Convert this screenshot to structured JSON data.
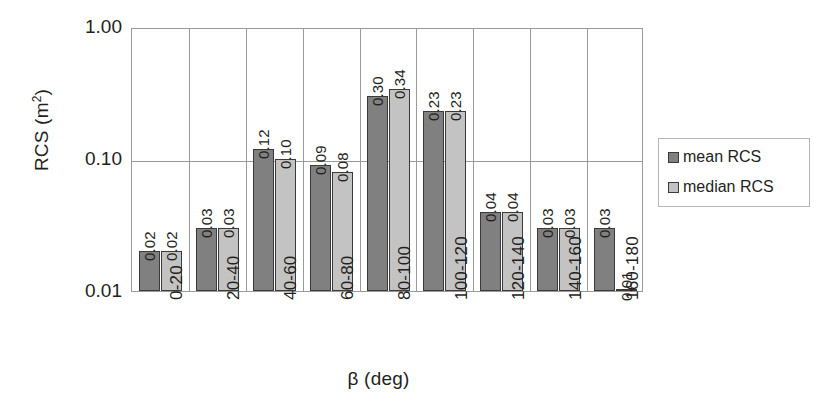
{
  "chart_data": {
    "type": "bar",
    "title": "",
    "xlabel": "β (deg)",
    "ylabel": "RCS (m²)",
    "yscale": "log",
    "ylim": [
      0.01,
      1.0
    ],
    "ytick_labels": [
      "1.00",
      "0.10",
      "0.01"
    ],
    "ytick_values": [
      1.0,
      0.1,
      0.01
    ],
    "grid": "horizontal-and-vertical",
    "legend_position": "right",
    "categories": [
      "0-20",
      "20-40",
      "40-60",
      "60-80",
      "80-100",
      "100-120",
      "120-140",
      "140-160",
      "160-180"
    ],
    "series": [
      {
        "name": "mean RCS",
        "color": "#808080",
        "values": [
          0.02,
          0.03,
          0.12,
          0.09,
          0.3,
          0.23,
          0.04,
          0.03,
          0.03
        ],
        "labels": [
          "0.02",
          "0.03",
          "0.12",
          "0.09",
          "0.30",
          "0.23",
          "0.04",
          "0.03",
          "0.03"
        ]
      },
      {
        "name": "median RCS",
        "color": "#c3c3c3",
        "values": [
          0.02,
          0.03,
          0.1,
          0.08,
          0.34,
          0.23,
          0.04,
          0.03,
          0.01
        ],
        "labels": [
          "0.02",
          "0.03",
          "0.10",
          "0.08",
          "0.34",
          "0.23",
          "0.04",
          "0.03",
          "0.01"
        ]
      }
    ]
  },
  "legend": {
    "items": [
      {
        "label": "mean RCS"
      },
      {
        "label": "median RCS"
      }
    ]
  }
}
